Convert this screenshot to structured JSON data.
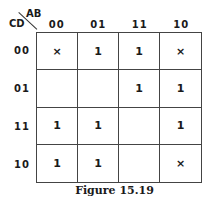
{
  "kmap": {
    "row_var": "CD",
    "col_var": "AB",
    "col_headers": [
      "00",
      "01",
      "11",
      "10"
    ],
    "row_headers": [
      "00",
      "01",
      "11",
      "10"
    ],
    "cells": [
      [
        "×",
        "1",
        "1",
        "×"
      ],
      [
        "",
        "",
        "1",
        "1"
      ],
      [
        "1",
        "1",
        "",
        "1"
      ],
      [
        "1",
        "1",
        "",
        "×"
      ]
    ]
  },
  "caption": "Figure 15.19"
}
